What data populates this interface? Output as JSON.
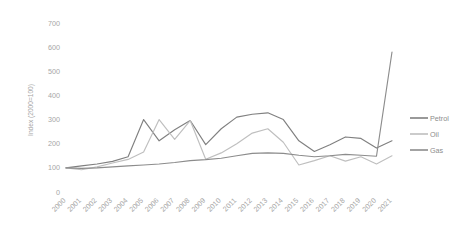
{
  "chart_data": {
    "type": "line",
    "title": "",
    "xlabel": "",
    "ylabel": "Index (2000=100)",
    "ylim": [
      0,
      700
    ],
    "ytick_values": [
      0,
      100,
      200,
      300,
      400,
      500,
      600,
      700
    ],
    "ytick_labels": [
      "0",
      "100",
      "200",
      "300",
      "400",
      "500",
      "600",
      "700"
    ],
    "grid": false,
    "legend_position": "right",
    "categories": [
      "2000",
      "2001",
      "2002",
      "2003",
      "2004",
      "2005",
      "2006",
      "2007",
      "2008",
      "2009",
      "2010",
      "2011",
      "2012",
      "2013",
      "2014",
      "2015",
      "2016",
      "2017",
      "2018",
      "2019",
      "2020",
      "2021"
    ],
    "series": [
      {
        "name": "Petrol",
        "color": "#808080",
        "values": [
          100,
          108,
          116,
          127,
          146,
          300,
          212,
          258,
          296,
          196,
          262,
          310,
          322,
          328,
          300,
          212,
          168,
          196,
          228,
          222,
          182,
          212
        ]
      },
      {
        "name": "Oil",
        "color": "#bfbfbf",
        "values": [
          100,
          92,
          104,
          120,
          135,
          166,
          300,
          218,
          296,
          136,
          162,
          200,
          244,
          262,
          206,
          112,
          130,
          150,
          128,
          146,
          116,
          150
        ]
      },
      {
        "name": "Gas",
        "color": "#8c8c8c",
        "values": [
          100,
          98,
          100,
          104,
          108,
          112,
          116,
          122,
          130,
          134,
          140,
          150,
          160,
          162,
          160,
          152,
          146,
          150,
          156,
          152,
          148,
          580
        ]
      }
    ],
    "legend": [
      {
        "label": "Petrol",
        "color": "#808080"
      },
      {
        "label": "Oil",
        "color": "#bfbfbf"
      },
      {
        "label": "Gas",
        "color": "#8c8c8c"
      }
    ]
  },
  "axes": {
    "y_axis_title": "Index (2000=100)"
  }
}
